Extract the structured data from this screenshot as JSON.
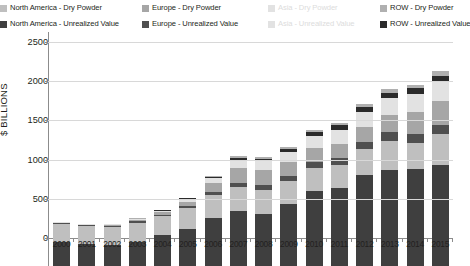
{
  "legend": {
    "items": [
      {
        "label": "North America - Dry Powder",
        "color": "#bfbfbf",
        "faded": false
      },
      {
        "label": "Europe - Dry Powder",
        "color": "#a6a6a6",
        "faded": false
      },
      {
        "label": "Asia - Dry Powder",
        "color": "#e2e2e2",
        "faded": true
      },
      {
        "label": "ROW - Dry Powder",
        "color": "#b0b0b0",
        "faded": false
      },
      {
        "label": "North America - Unrealized Value",
        "color": "#3f3f3f",
        "faded": false
      },
      {
        "label": "Europe - Unrealized Value",
        "color": "#4f4f4f",
        "faded": false
      },
      {
        "label": "Asia - Unrealized Value",
        "color": "#e2e2e2",
        "faded": true
      },
      {
        "label": "ROW - Unrealized Value",
        "color": "#2b2b2b",
        "faded": false
      }
    ]
  },
  "axis": {
    "y_title": "$ BILLIONS",
    "y_ticks": [
      "0",
      "500",
      "1000",
      "1500",
      "2000",
      "2500"
    ]
  },
  "chart_data": {
    "type": "bar",
    "stacked": true,
    "title": "",
    "xlabel": "",
    "ylabel": "$ BILLIONS",
    "ylim": [
      0,
      2500
    ],
    "ytick_values": [
      0,
      500,
      1000,
      1500,
      2000,
      2500
    ],
    "grid": true,
    "legend_position": "top",
    "categories": [
      "2000",
      "2001",
      "2002",
      "2003",
      "2004",
      "2005",
      "2006",
      "2007",
      "2008",
      "2009",
      "2010",
      "2011",
      "2012",
      "2013",
      "2014",
      "2015"
    ],
    "series": [
      {
        "name": "North America - Unrealized Value",
        "color": "#3f3f3f",
        "values": [
          310,
          275,
          270,
          300,
          390,
          470,
          610,
          700,
          660,
          790,
          960,
          990,
          1160,
          1230,
          1240,
          1290
        ]
      },
      {
        "name": "North America - Dry Powder",
        "color": "#bfbfbf",
        "values": [
          225,
          230,
          230,
          255,
          245,
          265,
          290,
          310,
          310,
          290,
          290,
          300,
          330,
          370,
          330,
          390
        ]
      },
      {
        "name": "Europe - Unrealized Value",
        "color": "#4f4f4f",
        "values": [
          10,
          12,
          13,
          16,
          22,
          30,
          45,
          55,
          60,
          65,
          80,
          85,
          95,
          110,
          120,
          125
        ]
      },
      {
        "name": "Europe - Dry Powder",
        "color": "#a6a6a6",
        "values": [
          8,
          10,
          12,
          18,
          30,
          50,
          110,
          185,
          190,
          180,
          175,
          185,
          190,
          220,
          270,
          300
        ]
      },
      {
        "name": "Asia - Unrealized Value",
        "color": "#e2e2e2",
        "values": [
          2,
          3,
          4,
          6,
          10,
          18,
          35,
          55,
          65,
          75,
          95,
          110,
          120,
          130,
          145,
          155
        ]
      },
      {
        "name": "Asia - Dry Powder",
        "color": "#e2e2e2",
        "values": [
          2,
          3,
          4,
          6,
          10,
          18,
          30,
          45,
          50,
          55,
          60,
          70,
          75,
          80,
          85,
          90
        ]
      },
      {
        "name": "ROW - Unrealized Value",
        "color": "#2b2b2b",
        "values": [
          2,
          3,
          4,
          5,
          8,
          12,
          20,
          30,
          35,
          40,
          45,
          55,
          60,
          70,
          75,
          80
        ]
      },
      {
        "name": "ROW - Dry Powder",
        "color": "#b0b0b0",
        "values": [
          1,
          2,
          3,
          4,
          5,
          7,
          10,
          20,
          20,
          25,
          30,
          35,
          40,
          45,
          50,
          55
        ]
      }
    ],
    "totals": [
      560,
      538,
      540,
      610,
      720,
      870,
      1150,
      1400,
      1390,
      1520,
      1735,
      1830,
      2070,
      2255,
      2315,
      2485
    ]
  }
}
